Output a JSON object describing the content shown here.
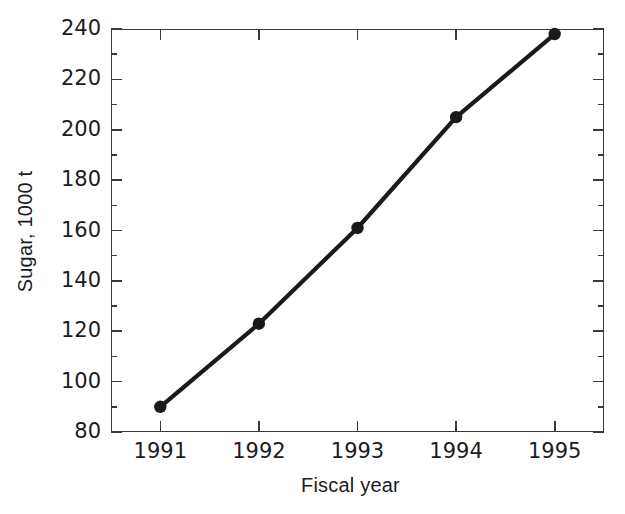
{
  "chart_data": {
    "type": "line",
    "title": "",
    "xlabel": "Fiscal year",
    "ylabel": "Sugar, 1000 t",
    "x": [
      1991,
      1992,
      1993,
      1994,
      1995
    ],
    "categories": [
      "1991",
      "1992",
      "1993",
      "1994",
      "1995"
    ],
    "values": [
      90,
      123,
      161,
      205,
      238
    ],
    "series": [
      {
        "name": "Sugar",
        "values": [
          90,
          123,
          161,
          205,
          238
        ]
      }
    ],
    "xlim": [
      1990.5,
      1995.5
    ],
    "ylim": [
      80,
      240
    ],
    "y_major_ticks": [
      80,
      100,
      120,
      140,
      160,
      180,
      200,
      220,
      240
    ],
    "y_minor_ticks": [
      90,
      110,
      130,
      150,
      170,
      190,
      210,
      230
    ],
    "x_major_ticks": [
      1991,
      1992,
      1993,
      1994,
      1995
    ],
    "y_tick_labels": [
      "80",
      "100",
      "120",
      "140",
      "160",
      "180",
      "200",
      "220",
      "240"
    ],
    "x_tick_labels": [
      "1991",
      "1992",
      "1993",
      "1994",
      "1995"
    ],
    "grid": false,
    "legend": false,
    "legend_position": "none",
    "marker": "filled-circle",
    "line_color": "#1a1a1a",
    "marker_color": "#1a1a1a",
    "axis_color": "#3a3a3a",
    "background_color": "#ffffff",
    "frame": "box-all-sides",
    "tick_direction": "in"
  }
}
